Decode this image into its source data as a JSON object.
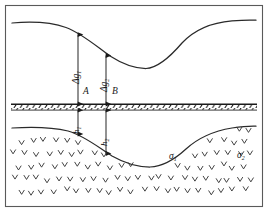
{
  "figure": {
    "frame": {
      "border_color": "#555555",
      "background": "#ffffff"
    },
    "colors": {
      "curve": "#2a2a2a",
      "arrow": "#1a1a1a",
      "ground": "#1a1a1a",
      "hatch": "#3a3a3a",
      "text": "#1a1a1a"
    },
    "labels": {
      "delta_g_1": {
        "base": "Δg",
        "sub": "1",
        "name": "delta-g-1-label"
      },
      "delta_g_2": {
        "base": "Δg",
        "sub": "2",
        "name": "delta-g-2-label"
      },
      "point_a": {
        "base": "A",
        "sub": "",
        "name": "point-a-label"
      },
      "point_b": {
        "base": "B",
        "sub": "",
        "name": "point-b-label"
      },
      "h_1": {
        "base": "h",
        "sub": "1",
        "name": "depth-h1-label"
      },
      "h_2": {
        "base": "h",
        "sub": "2",
        "name": "depth-h2-label"
      },
      "sigma_1": {
        "base": "σ",
        "sub": "1",
        "name": "density-sigma1-label"
      },
      "sigma_2": {
        "base": "σ",
        "sub": "2",
        "name": "density-sigma2-label"
      }
    },
    "elements": {
      "anomaly_curve": "gravity-anomaly-curve",
      "ground_surface": "ground-surface-line",
      "interface_curve": "density-interface-curve",
      "station_a_arrow": "station-a-measurement-arrow",
      "station_b_arrow": "station-b-measurement-arrow",
      "depth_h1_arrow": "depth-h1-arrow",
      "depth_h2_arrow": "depth-h2-arrow",
      "hatch_fill": "subsurface-hatch-fill"
    }
  },
  "chart_data": {
    "type": "line",
    "xlabel": "",
    "ylabel": "",
    "grid": false,
    "legend": null,
    "xlim": [
      0,
      268
    ],
    "ylim": [
      212,
      0
    ],
    "series": [
      {
        "name": "Δg anomaly curve",
        "comment": "Upper profile curve: high on the left flank, deep minimum at centre, rising again to the right",
        "points": [
          [
            12,
            23
          ],
          [
            40,
            22
          ],
          [
            62,
            26
          ],
          [
            78,
            34
          ],
          [
            96,
            48
          ],
          [
            112,
            58
          ],
          [
            128,
            65
          ],
          [
            142,
            68
          ],
          [
            156,
            66
          ],
          [
            170,
            56
          ],
          [
            186,
            40
          ],
          [
            204,
            28
          ],
          [
            224,
            22
          ],
          [
            244,
            20
          ],
          [
            256,
            20
          ]
        ]
      },
      {
        "name": "density interface",
        "comment": "Lower boundary between σ₁ (shallow body) and σ₂, mirrors the anomaly curve",
        "points": [
          [
            12,
            128
          ],
          [
            36,
            127
          ],
          [
            56,
            129
          ],
          [
            72,
            133
          ],
          [
            90,
            143
          ],
          [
            106,
            152
          ],
          [
            124,
            160
          ],
          [
            142,
            166
          ],
          [
            158,
            167
          ],
          [
            172,
            164
          ],
          [
            186,
            155
          ],
          [
            200,
            142
          ],
          [
            214,
            133
          ],
          [
            232,
            128
          ],
          [
            248,
            126
          ],
          [
            256,
            126
          ]
        ]
      },
      {
        "name": "ground surface",
        "comment": "Flat hatched datum line separating the anomaly plot from the subsurface model",
        "points": [
          [
            11,
            104
          ],
          [
            257,
            104
          ]
        ]
      }
    ],
    "annotations": [
      {
        "text": "Δg₁",
        "x": 66,
        "y": 72,
        "role": "anomaly amplitude at station A"
      },
      {
        "text": "Δg₂",
        "x": 100,
        "y": 76,
        "role": "anomaly amplitude at station B"
      },
      {
        "text": "A",
        "x": 84,
        "y": 94,
        "role": "measurement station A"
      },
      {
        "text": "B",
        "x": 113,
        "y": 94,
        "role": "measurement station B"
      },
      {
        "text": "h₁",
        "x": 68,
        "y": 126,
        "role": "depth to interface at A"
      },
      {
        "text": "h₂",
        "x": 96,
        "y": 136,
        "role": "depth to interface at B"
      },
      {
        "text": "σ₁",
        "x": 170,
        "y": 159,
        "role": "density of upper body"
      },
      {
        "text": "σ₂",
        "x": 238,
        "y": 158,
        "role": "density of surrounding medium"
      }
    ],
    "arrows": [
      {
        "name": "Δg₁",
        "x": 78,
        "y_top": 34,
        "y_bottom": 104,
        "double_headed": true
      },
      {
        "name": "Δg₂",
        "x": 106,
        "y_top": 55,
        "y_bottom": 104,
        "double_headed": true
      },
      {
        "name": "h₁",
        "x": 78,
        "y_top": 104,
        "y_bottom": 134,
        "double_headed": true
      },
      {
        "name": "h₂",
        "x": 106,
        "y_top": 104,
        "y_bottom": 153,
        "double_headed": true
      }
    ]
  }
}
